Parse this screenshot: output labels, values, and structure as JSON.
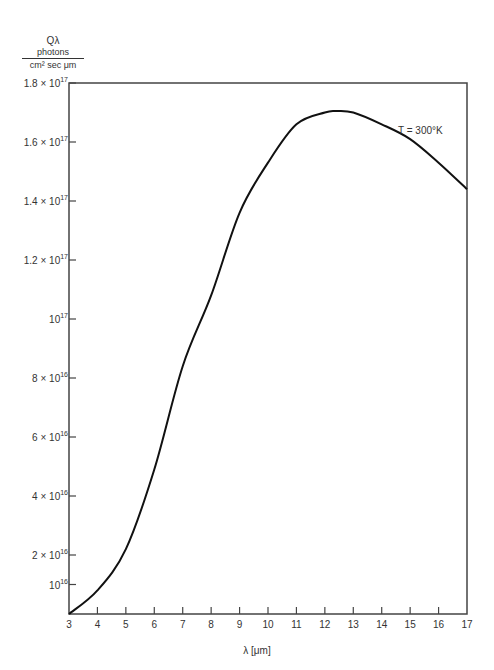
{
  "chart_data": {
    "type": "line",
    "title": "",
    "xlabel": "λ [μm]",
    "ylabel": "Qλ  photons / (cm² sec μm)",
    "ylabel_parts": {
      "symbol": "Qλ",
      "numerator": "photons",
      "denominator": "cm² sec μm"
    },
    "xlim": [
      3,
      17
    ],
    "ylim": [
      0,
      1.8e+17
    ],
    "grid": false,
    "legend": null,
    "x_ticks": [
      "3",
      "4",
      "5",
      "6",
      "7",
      "8",
      "9",
      "10",
      "11",
      "12",
      "13",
      "14",
      "15",
      "16",
      "17"
    ],
    "y_ticks": [
      {
        "value": 1e+16,
        "label": "10",
        "exp": "16",
        "prefix": ""
      },
      {
        "value": 2e+16,
        "label": "10",
        "exp": "16",
        "prefix": "2 × "
      },
      {
        "value": 4e+16,
        "label": "10",
        "exp": "16",
        "prefix": "4 × "
      },
      {
        "value": 6e+16,
        "label": "10",
        "exp": "16",
        "prefix": "6 × "
      },
      {
        "value": 8e+16,
        "label": "10",
        "exp": "16",
        "prefix": "8 × "
      },
      {
        "value": 1e+17,
        "label": "10",
        "exp": "17",
        "prefix": ""
      },
      {
        "value": 1.2e+17,
        "label": "10",
        "exp": "17",
        "prefix": "1.2 × "
      },
      {
        "value": 1.4e+17,
        "label": "10",
        "exp": "17",
        "prefix": "1.4 × "
      },
      {
        "value": 1.6e+17,
        "label": "10",
        "exp": "17",
        "prefix": "1.6 × "
      },
      {
        "value": 1.8e+17,
        "label": "10",
        "exp": "17",
        "prefix": "1.8 × "
      }
    ],
    "series": [
      {
        "name": "T = 300°K",
        "x": [
          3,
          4,
          5,
          6,
          7,
          8,
          9,
          10,
          11,
          12,
          12.4,
          13,
          14,
          15,
          16,
          17
        ],
        "values": [
          0,
          8000000000000000.0,
          2.2e+16,
          4.9e+16,
          8.4e+16,
          1.08e+17,
          1.36e+17,
          1.53e+17,
          1.66e+17,
          1.7e+17,
          1.705e+17,
          1.7e+17,
          1.66e+17,
          1.61e+17,
          1.53e+17,
          1.44e+17
        ]
      }
    ],
    "annotations": [
      {
        "text": "T = 300°K",
        "x": 14.5,
        "y": 1.65e+17
      }
    ]
  }
}
